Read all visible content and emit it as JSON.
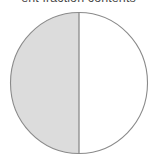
{
  "figure": {
    "caption": "ent fraction contents",
    "caption_clipped": true
  },
  "colors": {
    "slice_filled": "#dcdcdc",
    "slice_empty": "#ffffff",
    "outline": "#8a8a8a",
    "divider": "#8a8a8a",
    "caption_text": "#4a4a4a",
    "background": "#ffffff"
  },
  "chart_data": {
    "type": "pie",
    "title": "ent fraction contents",
    "labels": [
      "filled",
      "empty"
    ],
    "values": [
      50,
      50
    ],
    "value_unit": "%",
    "colors": [
      "#dcdcdc",
      "#ffffff"
    ],
    "start_angle": 90,
    "direction": "counterclockwise",
    "legend": false,
    "grid": false,
    "annotations": []
  }
}
